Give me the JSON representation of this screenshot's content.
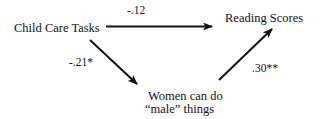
{
  "diagram": {
    "type": "mediation-path-diagram",
    "nodes": {
      "predictor": "Child Care Tasks",
      "outcome": "Reading Scores",
      "mediator_line1": "Women can do",
      "mediator_line2": "“male” things"
    },
    "paths": {
      "direct": {
        "from": "Child Care Tasks",
        "to": "Reading Scores",
        "coefficient": "-.12"
      },
      "a_path": {
        "from": "Child Care Tasks",
        "to": "Women can do “male” things",
        "coefficient": "-.21*"
      },
      "b_path": {
        "from": "Women can do “male” things",
        "to": "Reading Scores",
        "coefficient": ".30**"
      }
    },
    "colors": {
      "background": "#ffffff",
      "ink": "#111111"
    }
  }
}
